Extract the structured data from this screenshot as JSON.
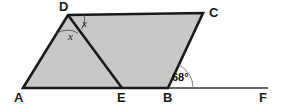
{
  "figure": {
    "kind": "geometry-diagram",
    "shape": "parallelogram-with-cevian",
    "width": 281,
    "height": 107,
    "background_color": "#ffffff",
    "fill_color": "#c8c8c8",
    "stroke_color": "#1a1a1a",
    "thin_stroke_color": "#333333",
    "arc_color": "#555555"
  },
  "vertices": {
    "A": {
      "label": "A",
      "x": 23,
      "y": 88,
      "label_x": 14,
      "label_y": 102
    },
    "B": {
      "label": "B",
      "x": 168,
      "y": 88,
      "label_x": 163,
      "label_y": 102
    },
    "C": {
      "label": "C",
      "x": 203,
      "y": 13,
      "label_x": 209,
      "label_y": 17
    },
    "D": {
      "label": "D",
      "x": 68,
      "y": 15,
      "label_x": 59,
      "label_y": 11
    },
    "E": {
      "label": "E",
      "x": 122,
      "y": 88,
      "label_x": 117,
      "label_y": 102
    },
    "F": {
      "label": "F",
      "x": 268,
      "y": 88,
      "label_x": 259,
      "label_y": 102
    }
  },
  "polygon": {
    "name": "parallelogram-ABCD",
    "points": "23,88 68,15 203,13 168,88"
  },
  "segments": [
    {
      "name": "segment-DE",
      "x1": 68,
      "y1": 15,
      "x2": 122,
      "y2": 88,
      "weight": "thick"
    },
    {
      "name": "segment-BF",
      "x1": 168,
      "y1": 88,
      "x2": 268,
      "y2": 88,
      "weight": "thin"
    }
  ],
  "angles": [
    {
      "name": "angle-ADE",
      "label": "x",
      "vertex": "D",
      "label_x": 68,
      "label_y": 40,
      "arc_path": "M 56.5 33.5 A 20 20 0 0 1 78 33"
    },
    {
      "name": "angle-EDC",
      "label": "x",
      "vertex": "D",
      "label_x": 82,
      "label_y": 27,
      "arc_path": "M 81.5 29 A 16 16 0 0 0 84 15"
    },
    {
      "name": "angle-CBF",
      "label": "68°",
      "vertex": "B",
      "label_x": 172,
      "label_y": 81,
      "arc_path": "M 179 65 A 25 25 0 0 1 193 88"
    }
  ],
  "labels": {
    "A": "A",
    "B": "B",
    "C": "C",
    "D": "D",
    "E": "E",
    "F": "F",
    "x1": "x",
    "x2": "x",
    "angle_value": "68°"
  }
}
